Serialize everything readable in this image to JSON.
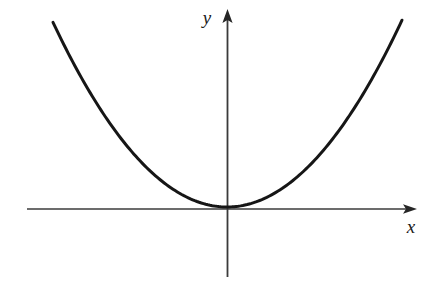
{
  "figure": {
    "background_color": "#ffffff",
    "curve_color": "#161616",
    "axis_color": "#3b3b3b",
    "label_color": "#1a1a1a",
    "x_axis_label": "x",
    "y_axis_label": "y"
  },
  "chart_data": {
    "type": "line",
    "title": "",
    "subtitle": "",
    "xlabel": "x",
    "ylabel": "y",
    "grid": false,
    "legend": null,
    "annotations": [],
    "axis_style": {
      "style": "cartesian-arrows",
      "x_axis_arrow": true,
      "y_axis_arrow": true,
      "ticks": false,
      "tick_labels": false
    },
    "xlim": [
      -2.85,
      3.1
    ],
    "ylim": [
      -1.1,
      3.25
    ],
    "origin_px": [
      227,
      209
    ],
    "x_axis_px": {
      "x_start": 27,
      "x_end": 417,
      "y": 209
    },
    "y_axis_px": {
      "y_top": 9,
      "y_bottom": 277,
      "x": 227
    },
    "series": [
      {
        "name": "parabola",
        "equation": "y = x^2",
        "color": "#161616",
        "line_width_px": 3,
        "vertex": [
          0,
          0
        ],
        "x": [
          -2.85,
          -2.6,
          -2.4,
          -2.2,
          -2.0,
          -1.8,
          -1.6,
          -1.4,
          -1.2,
          -1.0,
          -0.8,
          -0.6,
          -0.4,
          -0.2,
          0,
          0.2,
          0.4,
          0.6,
          0.8,
          1.0,
          1.2,
          1.4,
          1.6,
          1.8,
          2.0,
          2.2,
          2.4,
          2.6,
          2.87
        ],
        "values": [
          8.12,
          6.76,
          5.76,
          4.84,
          4.0,
          3.24,
          2.56,
          1.96,
          1.44,
          1.0,
          0.64,
          0.36,
          0.16,
          0.04,
          0,
          0.04,
          0.16,
          0.36,
          0.64,
          1.0,
          1.44,
          1.96,
          2.56,
          3.24,
          4.0,
          4.84,
          5.76,
          6.76,
          8.24
        ],
        "endpoints_px": [
          [
            53,
            22
          ],
          [
            402,
            22
          ]
        ],
        "px_scale": {
          "a": 0.0061,
          "vertex_px": [
            227,
            207
          ]
        }
      }
    ]
  }
}
